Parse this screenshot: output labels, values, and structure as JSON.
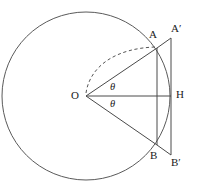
{
  "figure": {
    "type": "geometry-diagram",
    "colors": {
      "stroke": "#4a4a4a",
      "circle_stroke": "#5a5a5a",
      "dashed_stroke": "#555555",
      "label_color": "#1a1a1a",
      "background": "#ffffff"
    },
    "circle": {
      "center_x": 86,
      "center_y": 96,
      "radius": 84
    },
    "points": {
      "O": {
        "x": 86,
        "y": 96,
        "label": "O",
        "label_x": 71,
        "label_y": 91
      },
      "A": {
        "x": 157,
        "y": 48,
        "label": "A",
        "label_x": 149,
        "label_y": 30
      },
      "B": {
        "x": 157,
        "y": 145,
        "label": "B",
        "label_x": 150,
        "label_y": 152
      },
      "H": {
        "x": 171,
        "y": 96,
        "label": "H",
        "label_x": 176,
        "label_y": 90
      },
      "Aprime": {
        "x": 171,
        "y": 38,
        "label": "A′",
        "label_x": 172,
        "label_y": 24
      },
      "Bprime": {
        "x": 171,
        "y": 155,
        "label": "B′",
        "label_x": 172,
        "label_y": 158
      }
    },
    "angles": [
      {
        "label": "θ",
        "label_x": 110,
        "label_y": 83,
        "position": "upper"
      },
      {
        "label": "θ",
        "label_x": 110,
        "label_y": 100,
        "position": "lower"
      }
    ],
    "segments": [
      {
        "name": "OA",
        "from": "O",
        "to": "A",
        "style": "solid"
      },
      {
        "name": "OB",
        "from": "O",
        "to": "B",
        "style": "solid"
      },
      {
        "name": "OH",
        "from": "O",
        "to": "H",
        "style": "solid"
      },
      {
        "name": "AB-chord",
        "from": "A",
        "to": "B",
        "style": "solid"
      },
      {
        "name": "AAprime",
        "from": "A",
        "to": "Aprime",
        "style": "solid"
      },
      {
        "name": "BBprime",
        "from": "B",
        "to": "Bprime",
        "style": "solid"
      },
      {
        "name": "tangent-AprimeBprime",
        "from": "Aprime",
        "to": "Bprime",
        "style": "solid"
      }
    ],
    "dashed_arc": {
      "name": "arc-O-to-A",
      "style": "dashed",
      "from_x": 86,
      "from_y": 94,
      "to_x": 157,
      "to_y": 48
    }
  }
}
